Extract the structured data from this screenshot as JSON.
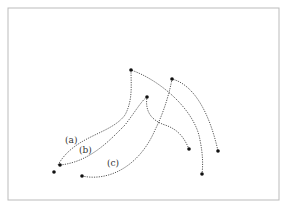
{
  "figure": {
    "frame": {
      "x": 8,
      "y": 8,
      "width": 271,
      "height": 192,
      "stroke": "#bbbbbb"
    },
    "curves": [
      {
        "id": "a",
        "label": "(a)",
        "label_pos": [
          65,
          143
        ],
        "path": "M58,165 C75,135 110,135 125,115 C133,100 131,85 131,70 C160,80 195,110 200,140 C203,155 203,165 202,174"
      },
      {
        "id": "b",
        "label": "(b)",
        "label_pos": [
          79,
          153
        ],
        "path": "M60,165 C90,162 110,140 125,125 C135,112 142,100 147,97 C145,110 150,120 165,125 C180,130 185,140 189,149"
      },
      {
        "id": "c",
        "label": "(c)",
        "label_pos": [
          107,
          166
        ],
        "path": "M82,176 C110,182 140,165 155,130 C165,110 170,90 172,79 C195,85 210,115 218,151"
      }
    ],
    "points": [
      [
        131,
        70
      ],
      [
        172,
        79
      ],
      [
        147,
        97
      ],
      [
        189,
        149
      ],
      [
        218,
        151
      ],
      [
        202,
        174
      ],
      [
        60,
        165
      ],
      [
        54,
        172
      ],
      [
        82,
        176
      ]
    ]
  }
}
